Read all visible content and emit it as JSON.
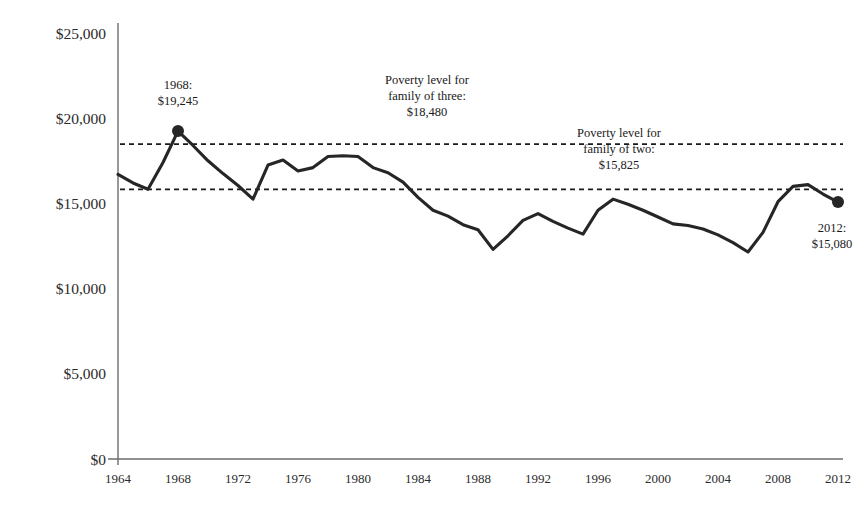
{
  "chart_data": {
    "type": "line",
    "title": "",
    "subtitle": "",
    "xlabel": "",
    "ylabel": "",
    "xlim": [
      1964,
      2012
    ],
    "ylim": [
      0,
      25000
    ],
    "grid": false,
    "legend": "none",
    "y_ticks": [
      0,
      5000,
      10000,
      15000,
      20000,
      25000
    ],
    "y_tick_labels": [
      "$0",
      "$5,000",
      "$10,000",
      "$15,000",
      "$20,000",
      "$25,000"
    ],
    "x_ticks": [
      1964,
      1968,
      1972,
      1976,
      1980,
      1984,
      1988,
      1992,
      1996,
      2000,
      2004,
      2008,
      2012
    ],
    "x_tick_labels": [
      "1964",
      "1968",
      "1972",
      "1976",
      "1980",
      "1984",
      "1988",
      "1992",
      "1996",
      "2000",
      "2004",
      "2008",
      "2012"
    ],
    "series": [
      {
        "name": "Annual value",
        "color": "#262626",
        "x": [
          1964,
          1965,
          1966,
          1967,
          1968,
          1969,
          1970,
          1971,
          1972,
          1973,
          1974,
          1975,
          1976,
          1977,
          1978,
          1979,
          1980,
          1981,
          1982,
          1983,
          1984,
          1985,
          1986,
          1987,
          1988,
          1989,
          1990,
          1991,
          1992,
          1993,
          1994,
          1995,
          1996,
          1997,
          1998,
          1999,
          2000,
          2001,
          2002,
          2003,
          2004,
          2005,
          2006,
          2007,
          2008,
          2009,
          2010,
          2011,
          2012
        ],
        "values": [
          16700,
          16200,
          15830,
          17400,
          19245,
          18400,
          17500,
          16750,
          16050,
          15250,
          17250,
          17550,
          16900,
          17100,
          17750,
          17800,
          17750,
          17100,
          16800,
          16250,
          15350,
          14600,
          14250,
          13750,
          13450,
          12300,
          13100,
          14000,
          14400,
          13950,
          13550,
          13200,
          14600,
          15250,
          14950,
          14600,
          14200,
          13800,
          13700,
          13500,
          13150,
          12700,
          12150,
          13300,
          15100,
          16000,
          16100,
          15550,
          15080
        ]
      }
    ],
    "reference_lines": [
      {
        "name": "poverty-level-family-of-three",
        "value": 18480,
        "label": "Poverty level for family of three: $18,480",
        "style": "dashed"
      },
      {
        "name": "poverty-level-family-of-two",
        "value": 15825,
        "label": "Poverty level for family of two: $15,825",
        "style": "dashed"
      }
    ],
    "markers": [
      {
        "name": "peak-1968",
        "x": 1968,
        "y": 19245
      },
      {
        "name": "end-2012",
        "x": 2012,
        "y": 15080
      }
    ],
    "annotations": [
      {
        "name": "peak-1968-annotation",
        "lines": [
          "1968:",
          "$19,245"
        ],
        "x": 1968,
        "y": 21700
      },
      {
        "name": "poverty-three-annotation",
        "lines": [
          "Poverty level for",
          "family of three:",
          "$18,480"
        ],
        "x": 1984.6,
        "y": 22000
      },
      {
        "name": "poverty-two-annotation",
        "lines": [
          "Poverty level for",
          "family of two:",
          "$15,825"
        ],
        "x": 1997.4,
        "y": 18900
      },
      {
        "name": "end-2012-annotation",
        "lines": [
          "2012:",
          "$15,080"
        ],
        "x": 2011.6,
        "y": 13300
      }
    ]
  },
  "colors": {
    "line": "#262626",
    "axis": "#6d6d6d",
    "text": "#1a1a1a",
    "background": "#ffffff"
  }
}
